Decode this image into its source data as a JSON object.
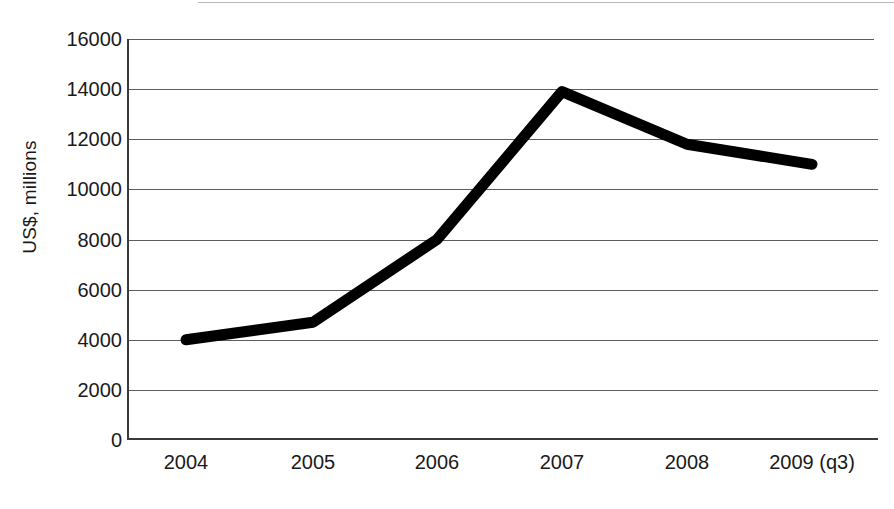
{
  "chart_data": {
    "type": "line",
    "title": "",
    "xlabel": "",
    "ylabel": "US$, millions",
    "categories": [
      "2004",
      "2005",
      "2006",
      "2007",
      "2008",
      "2009 (q3)"
    ],
    "series": [
      {
        "name": "US$, millions",
        "values": [
          4000,
          4700,
          8000,
          13900,
          11800,
          11000
        ]
      }
    ],
    "x": [
      "2004",
      "2005",
      "2006",
      "2007",
      "2008",
      "2009 (q3)"
    ],
    "values": [
      4000,
      4700,
      8000,
      13900,
      11800,
      11000
    ],
    "ylim": [
      0,
      16000
    ],
    "ytick_labels": [
      "16000",
      "14000",
      "12000",
      "10000",
      "8000",
      "6000",
      "4000",
      "2000",
      "0"
    ],
    "ytick_values": [
      16000,
      14000,
      12000,
      10000,
      8000,
      6000,
      4000,
      2000,
      0
    ],
    "ytick_step": 2000,
    "grid": "horizontal",
    "legend": "none",
    "line_color": "#000000",
    "line_width_px": 11,
    "axis_color": "#3a3a3a",
    "grid_color": "#5d5d5d",
    "background_color": "#ffffff"
  }
}
